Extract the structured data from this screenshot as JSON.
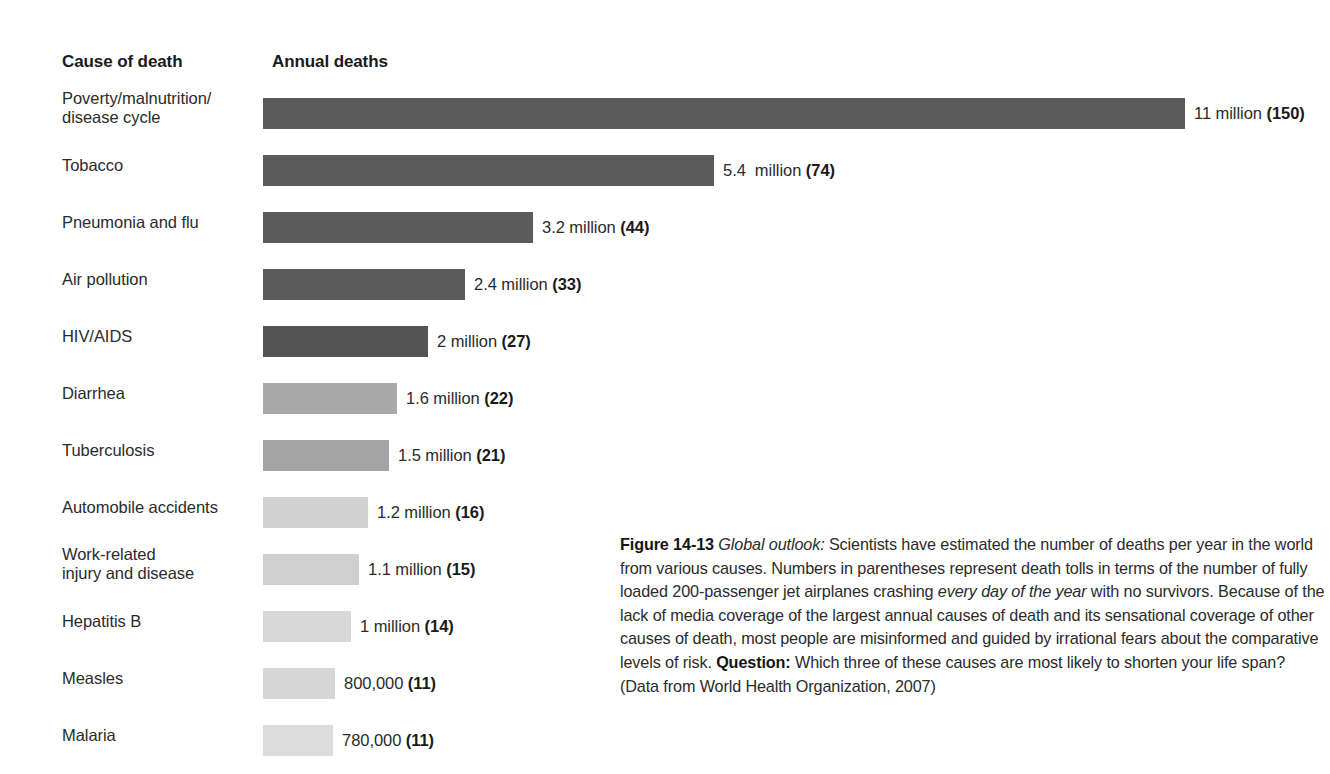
{
  "headers": {
    "cause": "Cause of death",
    "deaths": "Annual deaths"
  },
  "chart_data": {
    "type": "bar",
    "title": "Annual deaths",
    "xlabel": "Annual deaths",
    "ylabel": "Cause of death",
    "orientation": "horizontal",
    "grid": false,
    "legend": false,
    "xlim": [
      0,
      11
    ],
    "units": "millions of deaths per year",
    "categories": [
      "Poverty/malnutrition/\ndisease cycle",
      "Tobacco",
      "Pneumonia and flu",
      "Air pollution",
      "HIV/AIDS",
      "Diarrhea",
      "Tuberculosis",
      "Automobile accidents",
      "Work-related\ninjury and disease",
      "Hepatitis B",
      "Measles",
      "Malaria"
    ],
    "values": [
      11,
      5.4,
      3.2,
      2.4,
      2,
      1.6,
      1.5,
      1.2,
      1.1,
      1,
      0.8,
      0.78
    ],
    "jet_equivalents": [
      150,
      74,
      44,
      33,
      27,
      22,
      21,
      16,
      15,
      14,
      11,
      11
    ],
    "value_labels": [
      "11 million (150)",
      "5.4  million (74)",
      "3.2 million (44)",
      "2.4 million (33)",
      "2 million (27)",
      "1.6 million (22)",
      "1.5 million (21)",
      "1.2 million (16)",
      "1.1 million (15)",
      "1 million (14)",
      "800,000 (11)",
      "780,000 (11)"
    ]
  },
  "rows": [
    {
      "label": "Poverty/malnutrition/\ndisease cycle",
      "label_lines": 2,
      "value_text": "11 million ",
      "paren": "(150)",
      "bar_px": 922,
      "color": "#5b5b5b"
    },
    {
      "label": "Tobacco",
      "label_lines": 1,
      "value_text": "5.4  million ",
      "paren": "(74)",
      "bar_px": 451,
      "color": "#5b5b5b"
    },
    {
      "label": "Pneumonia and flu",
      "label_lines": 1,
      "value_text": "3.2 million ",
      "paren": "(44)",
      "bar_px": 270,
      "color": "#5b5b5b"
    },
    {
      "label": "Air pollution",
      "label_lines": 1,
      "value_text": "2.4 million ",
      "paren": "(33)",
      "bar_px": 202,
      "color": "#5b5b5b"
    },
    {
      "label": "HIV/AIDS",
      "label_lines": 1,
      "value_text": "2 million ",
      "paren": "(27)",
      "bar_px": 165,
      "color": "#545454"
    },
    {
      "label": "Diarrhea",
      "label_lines": 1,
      "value_text": "1.6 million ",
      "paren": "(22)",
      "bar_px": 134,
      "color": "#a9a9a9"
    },
    {
      "label": "Tuberculosis",
      "label_lines": 1,
      "value_text": "1.5 million ",
      "paren": "(21)",
      "bar_px": 126,
      "color": "#a3a3a3"
    },
    {
      "label": "Automobile accidents",
      "label_lines": 1,
      "value_text": "1.2 million ",
      "paren": "(16)",
      "bar_px": 105,
      "color": "#d2d2d2"
    },
    {
      "label": "Work-related\ninjury and disease",
      "label_lines": 2,
      "value_text": "1.1 million ",
      "paren": "(15)",
      "bar_px": 96,
      "color": "#cfcfcf"
    },
    {
      "label": "Hepatitis B",
      "label_lines": 1,
      "value_text": "1 million ",
      "paren": "(14)",
      "bar_px": 88,
      "color": "#d8d8d8"
    },
    {
      "label": "Measles",
      "label_lines": 1,
      "value_text": "800,000 ",
      "paren": "(11)",
      "bar_px": 72,
      "color": "#d6d6d6"
    },
    {
      "label": "Malaria",
      "label_lines": 1,
      "value_text": "780,000 ",
      "paren": "(11)",
      "bar_px": 70,
      "color": "#dcdcdc"
    }
  ],
  "caption": {
    "figure_number": "Figure 14-13",
    "lead_italic": "Global outlook:",
    "body_1": " Scientists have estimated the number of deaths per year in the world from various causes. Numbers in parentheses represent death tolls in terms of the number of fully loaded 200-passenger jet airplanes crashing ",
    "italic_1": "every day of the year",
    "body_2": " with no survivors. Because of the lack of media coverage of the largest annual causes of death and its sensational coverage of other causes of death, most people are misinformed and guided by irrational fears about the comparative levels of risk. ",
    "question_label": "Question:",
    "body_3": " Which three of these causes are most likely to shorten your life span? (Data from World Health Organization, 2007)"
  }
}
